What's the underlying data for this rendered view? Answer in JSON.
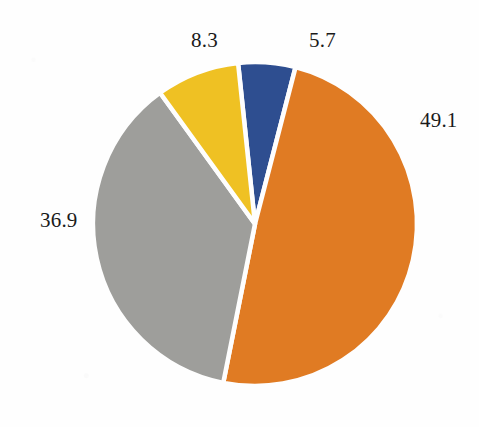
{
  "chart_data": {
    "type": "pie",
    "title": "",
    "subtitle": "",
    "xlabel": "",
    "ylabel": "",
    "legend": false,
    "legend_position": "none",
    "grid": false,
    "labels_shown": "values",
    "total": 100.0,
    "categories": [
      "5.7",
      "49.1",
      "36.9",
      "8.3"
    ],
    "values": [
      5.7,
      49.1,
      36.9,
      8.3
    ],
    "slices": [
      {
        "label": "5.7",
        "value": 5.7,
        "color": "#2E4E90",
        "color_name": "navy-blue",
        "start_angle": -6.0,
        "sweep_angle": 20.5,
        "label_x": 309,
        "label_y": 30
      },
      {
        "label": "49.1",
        "value": 49.1,
        "color": "#E07B23",
        "color_name": "orange",
        "start_angle": 14.5,
        "sweep_angle": 176.8,
        "label_x": 420,
        "label_y": 110
      },
      {
        "label": "36.9",
        "value": 36.9,
        "color": "#9E9E9B",
        "color_name": "gray",
        "start_angle": 191.3,
        "sweep_angle": 132.8,
        "label_x": 40,
        "label_y": 210
      },
      {
        "label": "8.3",
        "value": 8.3,
        "color": "#EFC123",
        "color_name": "gold-yellow",
        "start_angle": 324.1,
        "sweep_angle": 29.9,
        "label_x": 191,
        "label_y": 30
      }
    ],
    "geometry": {
      "center_x": 255,
      "center_y": 224,
      "radius": 162,
      "separator_color": "#FEFEFE",
      "separator_width": 4.5
    },
    "background_color": "#FEFEFE",
    "label_color": "#1A1A1A",
    "label_font_size": 21
  }
}
